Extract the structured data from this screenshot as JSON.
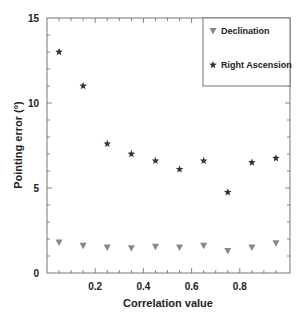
{
  "chart_data": {
    "type": "scatter",
    "title": "",
    "xlabel": "Correlation value",
    "ylabel": "Pointing error (°)",
    "xlim": [
      0,
      1.0
    ],
    "ylim": [
      0,
      15
    ],
    "x_ticks": [
      0.2,
      0.4,
      0.6,
      0.8
    ],
    "x_tick_labels": [
      "0.2",
      "0.4",
      "0.6",
      "0.8"
    ],
    "y_ticks": [
      0,
      5,
      10,
      15
    ],
    "y_tick_labels": [
      "0",
      "5",
      "10",
      "15"
    ],
    "grid": false,
    "legend_position": "upper right",
    "x": [
      0.05,
      0.15,
      0.25,
      0.35,
      0.45,
      0.55,
      0.65,
      0.75,
      0.85,
      0.95
    ],
    "series": [
      {
        "name": "Declination",
        "marker": "triangle-down",
        "color": "#888888",
        "values": [
          1.8,
          1.6,
          1.5,
          1.45,
          1.55,
          1.5,
          1.6,
          1.3,
          1.5,
          1.75
        ]
      },
      {
        "name": "Right Ascension",
        "marker": "star",
        "color": "#333333",
        "values": [
          13.0,
          11.0,
          7.6,
          7.0,
          6.6,
          6.1,
          6.6,
          4.75,
          6.5,
          6.75
        ]
      }
    ]
  }
}
